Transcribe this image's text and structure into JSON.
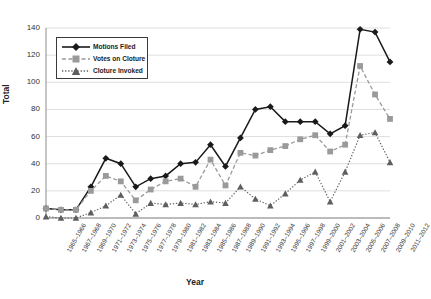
{
  "chart_data": {
    "type": "line",
    "title": "",
    "xlabel": "Year",
    "ylabel": "Total",
    "ylim": [
      0,
      140
    ],
    "yticks": [
      0,
      20,
      40,
      60,
      80,
      100,
      120,
      140
    ],
    "grid": true,
    "legend_position": "upper-left-inside",
    "categories": [
      "1965–1966",
      "1967–1968",
      "1969–1970",
      "1971–1972",
      "1973–1974",
      "1975–1976",
      "1977–1978",
      "1979–1980",
      "1981–1982",
      "1983–1984",
      "1985–1986",
      "1987–1988",
      "1989–1990",
      "1991–1992",
      "1993–1994",
      "1995–1996",
      "1997–1998",
      "1999–2000",
      "2001–2002",
      "2003–2004",
      "2005–2006",
      "2007–2008",
      "2009–2010",
      "2011–2012"
    ],
    "series": [
      {
        "name": "Motions Filed",
        "marker": "diamond",
        "linestyle": "solid",
        "color": "#1a1a1a",
        "values": [
          7,
          6,
          6,
          23,
          44,
          40,
          23,
          29,
          31,
          40,
          41,
          54,
          38,
          59,
          80,
          82,
          71,
          71,
          71,
          62,
          68,
          139,
          137,
          115
        ]
      },
      {
        "name": "Votes on Cloture",
        "marker": "square",
        "linestyle": "dashed",
        "color": "#9a9a9a",
        "values": [
          7,
          6,
          6,
          20,
          31,
          27,
          13,
          21,
          27,
          29,
          23,
          43,
          24,
          48,
          46,
          50,
          53,
          58,
          61,
          49,
          54,
          112,
          91,
          73
        ]
      },
      {
        "name": "Cloture Invoked",
        "marker": "triangle",
        "linestyle": "dotted",
        "color": "#5e5e5e",
        "values": [
          1,
          0,
          0,
          4,
          9,
          17,
          3,
          11,
          10,
          11,
          10,
          12,
          11,
          23,
          14,
          9,
          18,
          28,
          34,
          12,
          34,
          61,
          63,
          41
        ]
      }
    ]
  },
  "legend": {
    "items": [
      {
        "label": "Motions Filed"
      },
      {
        "label": "Votes on Cloture"
      },
      {
        "label": "Cloture Invoked"
      }
    ]
  }
}
